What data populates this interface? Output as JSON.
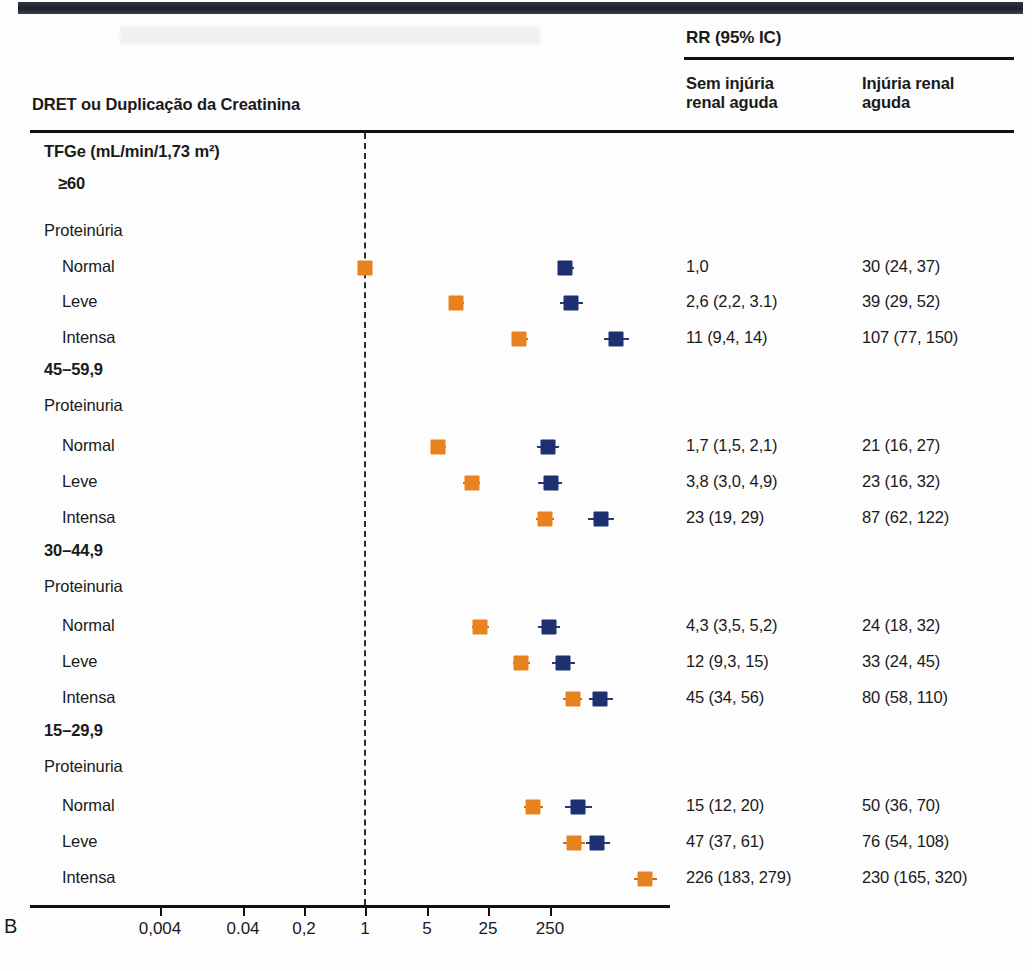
{
  "panel": {
    "letter": "B"
  },
  "header": {
    "left_title": "DRET ou Duplicação da Creatinina",
    "rr_title": "RR (95% IC)",
    "col1": "Sem injúria\nrenal aguda",
    "col1_line1": "Sem injúria",
    "col1_line2": "renal aguda",
    "col2_line1": "Injúria renal",
    "col2_line2": "aguda"
  },
  "axis": {
    "ticks": [
      "0,004",
      "0.04",
      "0,2",
      "1",
      "5",
      "25",
      "250"
    ],
    "tick_x": [
      160,
      243,
      304,
      365,
      427,
      488,
      550
    ],
    "null_value": "1"
  },
  "colors": {
    "series1": "#e8821e",
    "series2": "#1f3070",
    "rule": "#111111",
    "null_line": "#2b2b2b"
  },
  "legend": {
    "series1_name": "Sem injúria renal aguda",
    "series2_name": "Injúria renal aguda"
  },
  "rows": [
    {
      "label": "TFGe (mL/min/1,73 m²)",
      "level": "group",
      "y": 153
    },
    {
      "label": "≥60",
      "level": "sub",
      "y": 185
    },
    {
      "label": "Proteinúria",
      "level": "prot",
      "y": 232
    },
    {
      "label": "Normal",
      "level": "item",
      "y": 268,
      "v1": "1,0",
      "v2": "30 (24, 37)",
      "m1": 365,
      "m1lo": 365,
      "m1hi": 365,
      "m2": 565,
      "m2lo": 558,
      "m2hi": 574
    },
    {
      "label": "Leve",
      "level": "item",
      "y": 303,
      "v1": "2,6 (2,2, 3.1)",
      "v2": "39 (29, 52)",
      "m1": 456,
      "m1lo": 450,
      "m1hi": 464,
      "m2": 571,
      "m2lo": 560,
      "m2hi": 583
    },
    {
      "label": "Intensa",
      "level": "item",
      "y": 339,
      "v1": "11 (9,4, 14)",
      "v2": "107 (77, 150)",
      "m1": 519,
      "m1lo": 512,
      "m1hi": 528,
      "m2": 616,
      "m2lo": 604,
      "m2hi": 629
    },
    {
      "label": "45–59,9",
      "level": "group",
      "y": 371
    },
    {
      "label": "Proteinuria",
      "level": "prot",
      "y": 407
    },
    {
      "label": "Normal",
      "level": "item",
      "y": 447,
      "v1": "1,7 (1,5, 2,1)",
      "v2": "21 (16, 27)",
      "m1": 438,
      "m1lo": 432,
      "m1hi": 446,
      "m2": 548,
      "m2lo": 537,
      "m2hi": 559
    },
    {
      "label": "Leve",
      "level": "item",
      "y": 483,
      "v1": "3,8 (3,0, 4,9)",
      "v2": "23 (16, 32)",
      "m1": 472,
      "m1lo": 463,
      "m1hi": 480,
      "m2": 551,
      "m2lo": 538,
      "m2hi": 562
    },
    {
      "label": "Intensa",
      "level": "item",
      "y": 519,
      "v1": "23 (19, 29)",
      "v2": "87 (62, 122)",
      "m1": 545,
      "m1lo": 536,
      "m1hi": 554,
      "m2": 601,
      "m2lo": 588,
      "m2hi": 614
    },
    {
      "label": "30–44,9",
      "level": "group",
      "y": 552
    },
    {
      "label": "Proteinuria",
      "level": "prot",
      "y": 588
    },
    {
      "label": "Normal",
      "level": "item",
      "y": 627,
      "v1": "4,3 (3,5, 5,2)",
      "v2": "24 (18, 32)",
      "m1": 480,
      "m1lo": 472,
      "m1hi": 489,
      "m2": 549,
      "m2lo": 538,
      "m2hi": 560
    },
    {
      "label": "Leve",
      "level": "item",
      "y": 663,
      "v1": "12 (9,3, 15)",
      "v2": "33 (24, 45)",
      "m1": 521,
      "m1lo": 513,
      "m1hi": 530,
      "m2": 563,
      "m2lo": 552,
      "m2hi": 575
    },
    {
      "label": "Intensa",
      "level": "item",
      "y": 699,
      "v1": "45 (34, 56)",
      "v2": "80 (58, 110)",
      "m1": 573,
      "m1lo": 563,
      "m1hi": 582,
      "m2": 600,
      "m2lo": 589,
      "m2hi": 613
    },
    {
      "label": "15–29,9",
      "level": "group",
      "y": 732
    },
    {
      "label": "Proteinuria",
      "level": "prot",
      "y": 768
    },
    {
      "label": "Normal",
      "level": "item",
      "y": 807,
      "v1": "15 (12, 20)",
      "v2": "50 (36, 70)",
      "m1": 533,
      "m1lo": 524,
      "m1hi": 543,
      "m2": 578,
      "m2lo": 565,
      "m2hi": 592
    },
    {
      "label": "Leve",
      "level": "item",
      "y": 843,
      "v1": "47 (37, 61)",
      "v2": "76 (54, 108)",
      "m1": 574,
      "m1lo": 563,
      "m1hi": 585,
      "m2": 597,
      "m2lo": 586,
      "m2hi": 610
    },
    {
      "label": "Intensa",
      "level": "item",
      "y": 879,
      "v1": "226 (183, 279)",
      "v2": "230 (165, 320)",
      "m1": 645,
      "m1lo": 634,
      "m1hi": 657
    }
  ],
  "chart_data": {
    "type": "scatter",
    "title": "DRET ou Duplicação da Creatinina",
    "xlabel": "RR (95% IC)",
    "ylabel": "",
    "xscale": "log",
    "xticks": [
      0.004,
      0.04,
      0.2,
      1,
      5,
      25,
      250
    ],
    "xtick_labels": [
      "0,004",
      "0.04",
      "0,2",
      "1",
      "5",
      "25",
      "250"
    ],
    "reference_line": 1,
    "grid": false,
    "legend_position": "none",
    "categories": [
      "≥60 / Normal",
      "≥60 / Leve",
      "≥60 / Intensa",
      "45–59,9 / Normal",
      "45–59,9 / Leve",
      "45–59,9 / Intensa",
      "30–44,9 / Normal",
      "30–44,9 / Leve",
      "30–44,9 / Intensa",
      "15–29,9 / Normal",
      "15–29,9 / Leve",
      "15–29,9 / Intensa"
    ],
    "series": [
      {
        "name": "Sem injúria renal aguda",
        "color": "#e8821e",
        "values": [
          1.0,
          2.6,
          11,
          1.7,
          3.8,
          23,
          4.3,
          12,
          45,
          15,
          47,
          226
        ],
        "ci_low": [
          1.0,
          2.2,
          9.4,
          1.5,
          3.0,
          19,
          3.5,
          9.3,
          34,
          12,
          37,
          183
        ],
        "ci_high": [
          1.0,
          3.1,
          14,
          2.1,
          4.9,
          29,
          5.2,
          15,
          56,
          20,
          61,
          279
        ],
        "labels": [
          "1,0",
          "2,6 (2,2, 3.1)",
          "11 (9,4, 14)",
          "1,7 (1,5, 2,1)",
          "3,8 (3,0, 4,9)",
          "23 (19, 29)",
          "4,3 (3,5, 5,2)",
          "12 (9,3, 15)",
          "45 (34, 56)",
          "15 (12, 20)",
          "47 (37, 61)",
          "226 (183, 279)"
        ]
      },
      {
        "name": "Injúria renal aguda",
        "color": "#1f3070",
        "values": [
          30,
          39,
          107,
          21,
          23,
          87,
          24,
          33,
          80,
          50,
          76,
          230
        ],
        "ci_low": [
          24,
          29,
          77,
          16,
          16,
          62,
          18,
          24,
          58,
          36,
          54,
          165
        ],
        "ci_high": [
          37,
          52,
          150,
          27,
          32,
          122,
          32,
          45,
          110,
          70,
          108,
          320
        ],
        "labels": [
          "30 (24, 37)",
          "39 (29, 52)",
          "107 (77, 150)",
          "21 (16, 27)",
          "23 (16, 32)",
          "87 (62, 122)",
          "24 (18, 32)",
          "33 (24, 45)",
          "80 (58, 110)",
          "50 (36, 70)",
          "76 (54, 108)",
          "230 (165, 320)"
        ]
      }
    ]
  }
}
